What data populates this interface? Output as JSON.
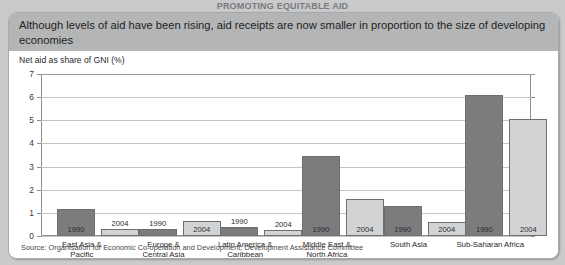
{
  "clipped_header": "PROMOTING EQUITABLE AID",
  "banner": {
    "text": "Although levels of aid have been rising, aid receipts are now smaller in proportion to the size of developing economies"
  },
  "source": {
    "text": "Source: Organisation for Economic Co-operation and Development, Development Assistance Committee"
  },
  "chart_data": {
    "type": "bar",
    "title": "Although levels of aid have been rising, aid receipts are now smaller in proportion to the size of developing economies",
    "ylabel": "Net aid as share of GNI (%)",
    "xlabel": "",
    "ylim": [
      0,
      7
    ],
    "yticks": [
      0,
      1,
      2,
      3,
      4,
      5,
      6,
      7
    ],
    "ytick_labels": [
      "0",
      "1",
      "2",
      "3",
      "4",
      "5",
      "6",
      "7"
    ],
    "grid": true,
    "legend": "none",
    "categories": [
      "East Asia & Pacific",
      "Europe & Central Asia",
      "Latin America & Caribbean",
      "Middle East & North Africa",
      "South Asia",
      "Sub-Saharan Africa"
    ],
    "category_lines": [
      [
        "East Asia &",
        "Pacific"
      ],
      [
        "Europe &",
        "Central Asia"
      ],
      [
        "Latin America &",
        "Caribbean"
      ],
      [
        "Middle East &",
        "North Africa"
      ],
      [
        "South Asia",
        ""
      ],
      [
        "Sub-Saharan Africa",
        ""
      ]
    ],
    "series": [
      {
        "name": "1990",
        "color": "#7b7c7e",
        "values": [
          1.15,
          0.3,
          0.4,
          3.45,
          1.3,
          6.1
        ]
      },
      {
        "name": "2004",
        "color": "#d2d3d4",
        "values": [
          0.3,
          0.65,
          0.25,
          1.6,
          0.6,
          5.05
        ]
      }
    ],
    "bar_value_labels": {
      "1990": [
        "1990",
        "1990",
        "1990",
        "1990",
        "1990",
        "1990"
      ],
      "2004": [
        "2004",
        "2004",
        "2004",
        "2004",
        "2004",
        "2004"
      ]
    }
  },
  "colors": {
    "page_background": "#c9cacb",
    "panel_background": "#ffffff",
    "banner_background": "#b4b5b7",
    "bar_1990": "#7b7c7e",
    "bar_2004": "#d2d3d4",
    "gridline": "#c3c4c6",
    "axis": "#8d8e90"
  }
}
